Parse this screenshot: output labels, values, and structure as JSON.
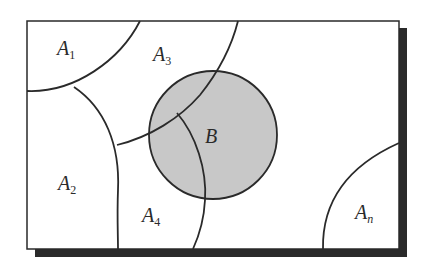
{
  "diagram": {
    "type": "set-partition",
    "colors": {
      "background": "#ffffff",
      "frame_stroke": "#2a2a2a",
      "shadow": "#2a2a2a",
      "event_fill": "#c8c8c8",
      "curve_stroke": "#2a2a2a"
    },
    "regions": [
      {
        "id": "A1",
        "label": "A",
        "subscript": "1"
      },
      {
        "id": "A2",
        "label": "A",
        "subscript": "2"
      },
      {
        "id": "A3",
        "label": "A",
        "subscript": "3"
      },
      {
        "id": "A4",
        "label": "A",
        "subscript": "4"
      },
      {
        "id": "An",
        "label": "A",
        "subscript": "n"
      }
    ],
    "event": {
      "id": "B",
      "label": "B",
      "shape": "circle",
      "shaded": true
    }
  }
}
